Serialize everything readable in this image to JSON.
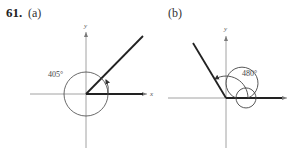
{
  "problem": {
    "number": "61.",
    "parts": [
      {
        "label": "(a)",
        "angle_label": "405°",
        "angle_degrees": 405,
        "terminal_side_degrees": 45,
        "axis_labels": {
          "x": "x",
          "y": "y"
        }
      },
      {
        "label": "(b)",
        "angle_label": "480°",
        "angle_degrees": 480,
        "terminal_side_degrees": 120,
        "axis_labels": {
          "y": "y"
        }
      }
    ]
  },
  "colors": {
    "axis": "#7a7a7a",
    "terminal_side": "#222222",
    "arc": "#444444"
  }
}
